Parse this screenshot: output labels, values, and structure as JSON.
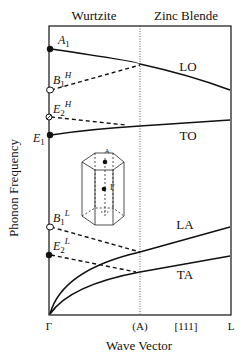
{
  "header": {
    "left_region": "Wurtzite",
    "right_region": "Zinc Blende"
  },
  "axes": {
    "ylabel": "Phonon Frequency",
    "xlabel": "Wave Vector",
    "xticks": [
      "Γ",
      "(A)",
      "[111]",
      "L"
    ]
  },
  "branches": {
    "lo": "LO",
    "to": "TO",
    "la": "LA",
    "ta": "TA"
  },
  "modes": {
    "a1": {
      "base": "A",
      "sub": "1",
      "sup": "",
      "marker": "filled"
    },
    "b1h": {
      "base": "B",
      "sub": "1",
      "sup": "H",
      "marker": "open"
    },
    "e2h": {
      "base": "E",
      "sub": "2",
      "sup": "H",
      "marker": "hatched"
    },
    "e1": {
      "base": "E",
      "sub": "1",
      "sup": "",
      "marker": "filled"
    },
    "b1l": {
      "base": "B",
      "sub": "1",
      "sup": "L",
      "marker": "open"
    },
    "e2l": {
      "base": "E",
      "sub": "2",
      "sup": "L",
      "marker": "filled"
    }
  },
  "inset": {
    "top_label": "A",
    "center_label": "Γ"
  },
  "colors": {
    "line": "#111111",
    "background": "#ffffff"
  }
}
